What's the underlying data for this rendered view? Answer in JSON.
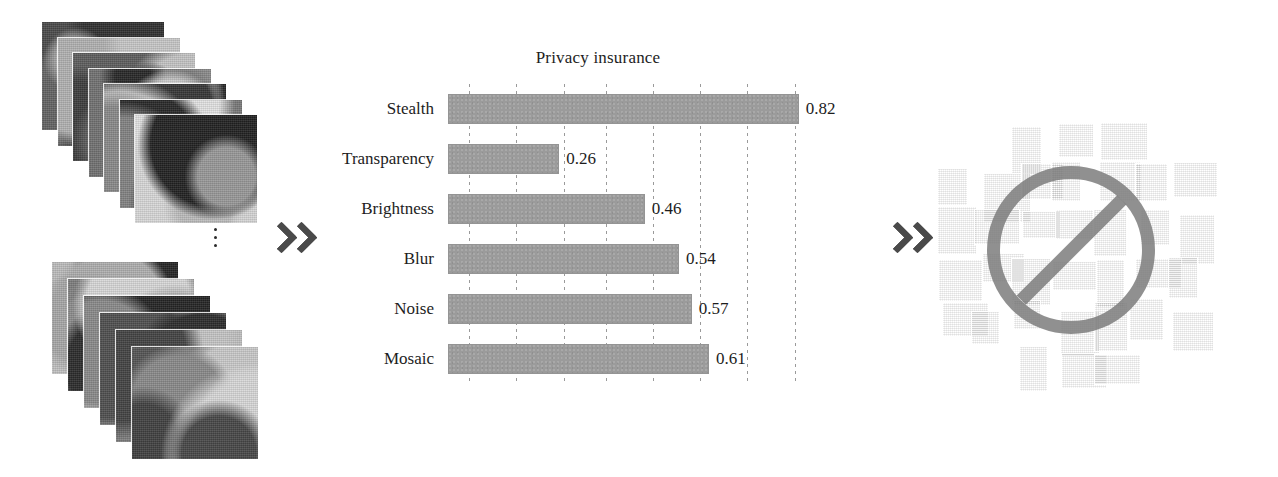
{
  "figure": {
    "caption_absent": true,
    "background": "#ffffff",
    "arrow_glyph": "double-chevron-right",
    "arrow_color": "#4a4a4a"
  },
  "left_panel": {
    "name": "input-image-stacks",
    "description_absent": true,
    "ellipsis_glyph": "vertical-dots",
    "stack_top": {
      "count": 7
    },
    "stack_bottom": {
      "count": 6
    }
  },
  "arrows": [
    {
      "name": "arrow-input-to-chart",
      "glyph": "»"
    },
    {
      "name": "arrow-chart-to-output",
      "glyph": "»"
    }
  ],
  "chart_data": {
    "type": "bar",
    "orientation": "horizontal",
    "title": "Privacy insurance",
    "xlabel": "",
    "ylabel": "",
    "categories": [
      "Stealth",
      "Transparency",
      "Brightness",
      "Blur",
      "Noise",
      "Mosaic"
    ],
    "values": [
      0.82,
      0.26,
      0.46,
      0.54,
      0.57,
      0.61
    ],
    "value_labels": [
      "0.82",
      "0.26",
      "0.46",
      "0.54",
      "0.57",
      "0.61"
    ],
    "xlim": [
      0,
      0.9
    ],
    "gridlines": {
      "visible": true,
      "style": "dotted",
      "orientation": "vertical",
      "count": 8
    },
    "gridline_values": [
      0.05,
      0.16,
      0.27,
      0.37,
      0.48,
      0.59,
      0.7,
      0.81
    ],
    "bar_color": "#9b9b9b",
    "text_color": "#1d1d1d",
    "legend": null
  },
  "right_panel": {
    "name": "output-image-collage",
    "overlay": {
      "name": "prohibition-sign",
      "glyph": "no-entry-circle-slash",
      "color": "#787878"
    },
    "photo_count": 40
  }
}
